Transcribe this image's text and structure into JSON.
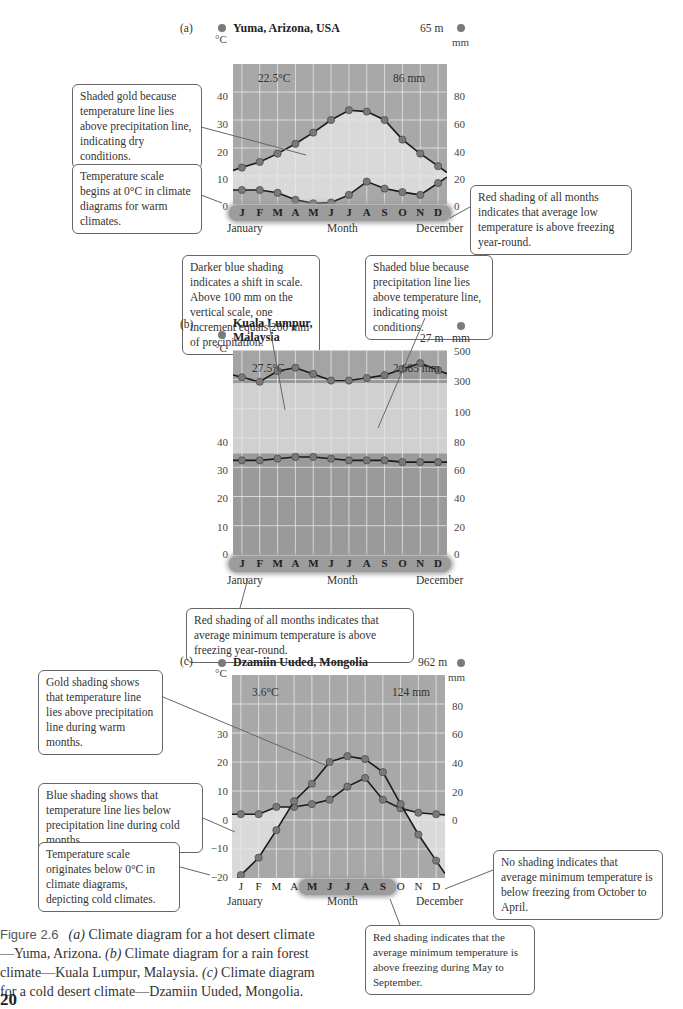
{
  "figure": {
    "number": "Figure 2.6",
    "caption_parts": {
      "a_label": "(a)",
      "a_text": " Climate diagram for a hot desert climate—Yuma, Arizona. ",
      "b_label": "(b)",
      "b_text": " Climate diagram for a rain forest climate—Kuala Lumpur, Malaysia. ",
      "c_label": "(c)",
      "c_text": " Climate diagram for a cold desert climate—Dzamiin Uuded, Mongolia."
    },
    "page_number": "20"
  },
  "colors": {
    "plot_bg": "#a8a8a8",
    "dry_shade": "#d9d9d9",
    "moist_shade": "#d0d0d0",
    "wet_dark": "#9a9a9a",
    "grid": "#e8e8e8",
    "line": "#1a1a1a",
    "dot": "#7a7a7a",
    "month_band": "#9c9c9c"
  },
  "month_axis": {
    "months": [
      "J",
      "F",
      "M",
      "A",
      "M",
      "J",
      "J",
      "A",
      "S",
      "O",
      "N",
      "D"
    ],
    "start_label": "January",
    "mid_label": "Month",
    "end_label": "December"
  },
  "panels": {
    "a": {
      "panel_label": "(a)",
      "station": "Yuma, Arizona, USA",
      "elevation": "65 m",
      "mean_temp": "22.5°C",
      "annual_precip": "86 mm",
      "temp_unit": "°C",
      "precip_unit": "mm",
      "temp_ticks": [
        "40",
        "30",
        "20",
        "10",
        "0"
      ],
      "precip_ticks": [
        "80",
        "60",
        "40",
        "20",
        "0"
      ]
    },
    "b": {
      "panel_label": "(b)",
      "station_line1": "Kuala Lumpur,",
      "station_line2": "Malaysia",
      "elevation": "27 m",
      "mean_temp": "27.5°C",
      "annual_precip": "2,685 mm",
      "temp_unit": "°C",
      "precip_unit": "mm",
      "temp_ticks": [
        "40",
        "30",
        "20",
        "10",
        "0"
      ],
      "precip_ticks": [
        "500",
        "300",
        "100",
        "80",
        "60",
        "40",
        "20",
        "0"
      ]
    },
    "c": {
      "panel_label": "(c)",
      "station": "Dzamiin Uuded, Mongolia",
      "elevation": "962 m",
      "mean_temp": "3.6°C",
      "annual_precip": "124 mm",
      "temp_unit": "°C",
      "precip_unit": "mm",
      "temp_ticks": [
        "30",
        "20",
        "10",
        "0",
        "−10",
        "−20"
      ],
      "precip_ticks": [
        "80",
        "60",
        "40",
        "20",
        "0"
      ]
    }
  },
  "notes": {
    "a_gold": "Shaded gold because temperature line lies above precipitation line, indicating dry conditions.",
    "a_scale": "Temperature scale begins at 0°C in climate diagrams for warm climates.",
    "a_red": "Red shading of all months indicates that average low temperature is above freezing year-round.",
    "b_dark": "Darker blue shading indicates a shift in scale. Above 100 mm on the vertical scale, one increment equals 200 mm of precipitation.",
    "b_blue": "Shaded blue because precipitation line lies above temperature line, indicating moist conditions.",
    "b_red": "Red shading of all months indicates that average minimum temperature is above freezing year-round.",
    "c_gold": "Gold shading shows that temperature line lies above precipitation line during warm months.",
    "c_blue": "Blue shading shows that temperature line lies below precipitation line during cold months.",
    "c_scale": "Temperature scale originates below 0°C in climate diagrams, depicting cold climates.",
    "c_none": "No shading indicates that average minimum temperature is below freezing from October to April.",
    "c_red": "Red shading indicates that the average minimum temperature is above freezing during May to September."
  },
  "chart_data": [
    {
      "type": "line",
      "title": "Yuma, Arizona, USA",
      "x": [
        "J",
        "F",
        "M",
        "A",
        "M",
        "J",
        "J",
        "A",
        "S",
        "O",
        "N",
        "D"
      ],
      "xlabel": "Month",
      "series": [
        {
          "name": "Temperature (°C)",
          "axis": "left",
          "values": [
            13,
            15,
            18,
            21.5,
            25.5,
            30,
            33.5,
            33,
            30,
            23,
            18,
            13.5
          ]
        },
        {
          "name": "Precipitation (mm)",
          "axis": "right",
          "values": [
            10,
            10,
            8,
            3,
            0.5,
            1,
            6.5,
            16,
            11,
            8.5,
            6.5,
            15
          ]
        }
      ],
      "ylabel_left": "°C",
      "ylim_left": [
        0,
        50
      ],
      "ylabel_right": "mm",
      "ylim_right": [
        0,
        100
      ],
      "annotations": [
        "65 m",
        "22.5°C",
        "86 mm"
      ]
    },
    {
      "type": "line",
      "title": "Kuala Lumpur, Malaysia",
      "x": [
        "J",
        "F",
        "M",
        "A",
        "M",
        "J",
        "J",
        "A",
        "S",
        "O",
        "N",
        "D"
      ],
      "xlabel": "Month",
      "series": [
        {
          "name": "Temperature (°C)",
          "axis": "left",
          "values": [
            27.5,
            27.5,
            28,
            28.5,
            28.5,
            28,
            27.5,
            27.5,
            27.5,
            27,
            27,
            27
          ]
        },
        {
          "name": "Precipitation (mm)",
          "axis": "right",
          "values": [
            170,
            115,
            245,
            285,
            210,
            130,
            130,
            160,
            195,
            270,
            340,
            255
          ]
        }
      ],
      "ylabel_left": "°C",
      "ylim_left": [
        0,
        50
      ],
      "ylabel_right": "mm",
      "right_axis_note": "scale changes above 100 mm (200 mm per increment)",
      "annotations": [
        "27 m",
        "27.5°C",
        "2,685 mm"
      ]
    },
    {
      "type": "line",
      "title": "Dzamiin Uuded, Mongolia",
      "x": [
        "J",
        "F",
        "M",
        "A",
        "M",
        "J",
        "J",
        "A",
        "S",
        "O",
        "N",
        "D"
      ],
      "xlabel": "Month",
      "series": [
        {
          "name": "Temperature (°C)",
          "axis": "left",
          "values": [
            -19,
            -13,
            -3.5,
            6.5,
            12.5,
            20,
            22,
            21,
            16.5,
            5.5,
            -5,
            -14
          ]
        },
        {
          "name": "Precipitation (mm)",
          "axis": "right",
          "values": [
            4,
            4,
            9,
            9,
            11,
            14,
            23,
            29,
            14,
            8,
            5,
            4
          ]
        }
      ],
      "ylabel_left": "°C",
      "ylim_left": [
        -20,
        40
      ],
      "ylabel_right": "mm",
      "ylim_right": [
        0,
        100
      ],
      "annotations": [
        "962 m",
        "3.6°C",
        "124 mm"
      ]
    }
  ]
}
